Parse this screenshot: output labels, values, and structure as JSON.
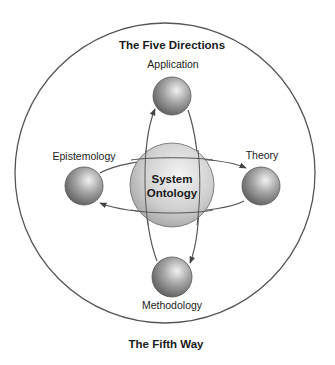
{
  "diagram": {
    "top_title": "The Five Directions",
    "bottom_title": "The Fifth Way",
    "center": {
      "line1": "System",
      "line2": "Ontology"
    },
    "nodes": {
      "top": "Application",
      "left": "Epistemology",
      "right": "Theory",
      "bottom": "Methodology"
    },
    "flows": [
      {
        "from": "Epistemology",
        "to": "Theory",
        "path": "upper horizontal arc"
      },
      {
        "from": "Theory",
        "to": "Epistemology",
        "path": "lower horizontal arc"
      },
      {
        "from": "Methodology",
        "to": "Application",
        "path": "left vertical arc"
      },
      {
        "from": "Application",
        "to": "Methodology",
        "path": "right vertical arc"
      }
    ],
    "colors": {
      "outline": "#555555",
      "sphere_light": "#f2f2f2",
      "sphere_dark": "#6e6e6e",
      "core_light": "#f4f4f4",
      "core_dark": "#a9a9a9"
    }
  }
}
